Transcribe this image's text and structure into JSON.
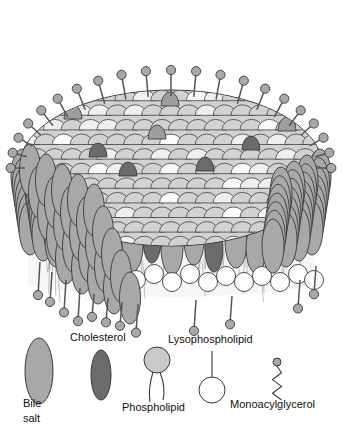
{
  "figure": {
    "background_color": "#ffffff",
    "width": 342,
    "height": 439
  },
  "colors": {
    "bile_salt_fill": "#a8a8a8",
    "bile_salt_top_fill": "#9d9d9d",
    "cholesterol_fill": "#6b6b6b",
    "phospholipid_fill": "#c9c9c9",
    "lysophospholipid_fill": "#fdfdfd",
    "scale_light_fill": "#d2d2d2",
    "scale_pale_fill": "#efefef",
    "scale_white_fill": "#fbfbfb",
    "head_fill": "#a8a8a8",
    "stroke": "#3a3a3a",
    "tail_stroke": "#555555",
    "core_fill": "#f6f6f6",
    "text": "#111111"
  },
  "micelle": {
    "name": "mixed-micelle",
    "dome_center_x": 171,
    "dome_center_y": 168,
    "dome_rx": 152,
    "dome_ry": 78,
    "wall_top_y": 150,
    "wall_bottom_y": 292,
    "scale_rows": 11,
    "scale_cols": 17,
    "top_stalk_count": 21,
    "bottom_stalk_count": 12,
    "wall_ellipse_rows": 4,
    "head_radius": 4.6,
    "stalk_length": 26
  },
  "legend": {
    "name": "legend",
    "items": [
      {
        "id": "bile-salt",
        "label": "Bile\nsalt",
        "shape": "ellipse",
        "fill_key": "bile_salt_fill",
        "x": 39,
        "y": 371,
        "rx": 14,
        "ry": 33,
        "label_x": 23,
        "label_y": 396,
        "label_lines": 2
      },
      {
        "id": "cholesterol",
        "label": "Cholesterol",
        "shape": "ellipse",
        "fill_key": "cholesterol_fill",
        "x": 101,
        "y": 375,
        "rx": 10,
        "ry": 25,
        "label_x": 70,
        "label_y": 331,
        "label_lines": 1
      },
      {
        "id": "phospholipid",
        "label": "Phospholipid",
        "shape": "circle-two-tails",
        "fill_key": "phospholipid_fill",
        "x": 157,
        "y": 360,
        "r": 13,
        "label_x": 122,
        "label_y": 401,
        "label_lines": 1
      },
      {
        "id": "lysophospholipid",
        "label": "Lysophospholipid",
        "shape": "circle-one-stalk",
        "fill_key": "lysophospholipid_fill",
        "x": 212,
        "y": 390,
        "r": 13,
        "label_x": 168,
        "label_y": 333,
        "label_lines": 1
      },
      {
        "id": "monoacylglycerol",
        "label": "Monoacylglycerol",
        "shape": "dot-zigzag",
        "fill_key": "head_fill",
        "x": 277,
        "y": 362,
        "r": 4,
        "label_x": 230,
        "label_y": 398,
        "label_lines": 1
      }
    ]
  }
}
